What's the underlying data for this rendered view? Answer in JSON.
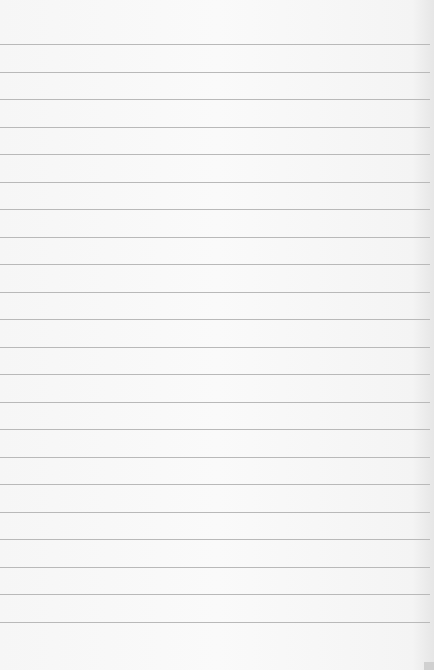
{
  "paper": {
    "type": "lined-paper",
    "line_count": 22,
    "first_line_y": 44,
    "line_spacing": 27.5,
    "line_color": "#b9b9b9",
    "background_color": "#f7f7f7"
  }
}
